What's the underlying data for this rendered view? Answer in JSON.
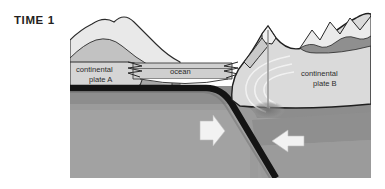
{
  "figure": {
    "time_label": "TIME 1",
    "caption_line1": "beginning of",
    "caption_line2": "continental collision"
  },
  "labels": {
    "plate_a_line1": "continental",
    "plate_a_line2": "plate A",
    "plate_b_line1": "continental",
    "plate_b_line2": "plate B",
    "ocean": "ocean"
  },
  "icons": {
    "subduction_arrow": "down-arrow-icon",
    "convergence_arrow": "left-arrow-icon",
    "crumple_left": "crumple-zone-icon",
    "crumple_right": "crumple-zone-icon",
    "magma_arcs": "deformation-arcs-icon",
    "root_blob": "crustal-root-icon"
  },
  "colors": {
    "panel_background": "#d8d8d8",
    "mantle_upper": "#8d8d8d",
    "mantle_lower": "#9e9e9e",
    "mantle_deep": "#8a8a8a",
    "plate_light": "#d3d3d3",
    "plate_mid": "#b5b5b5",
    "plate_dark": "#9a9a9a",
    "mountain_light": "#e6e6e6",
    "mountain_shadow": "#7f7f7f",
    "slab_outline": "#1a1a1a",
    "ocean_fill": "#c9c9c9",
    "arrow_fill": "#f2f2f2",
    "text": "#231f20"
  }
}
